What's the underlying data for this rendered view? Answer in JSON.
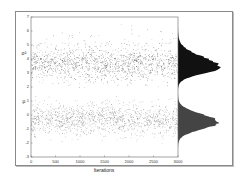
{
  "chart_data": {
    "type": "scatter",
    "title": "",
    "xlabel": "Iterations",
    "ylabel_series": [
      "σ²",
      "μ"
    ],
    "xlim": [
      0,
      3000
    ],
    "ylim": [
      -3,
      7
    ],
    "x_ticks": [
      0,
      500,
      1000,
      1500,
      2000,
      2500,
      3000
    ],
    "y_ticks": [
      -3,
      -2,
      -1,
      0,
      1,
      2,
      3,
      4,
      5,
      6,
      7
    ],
    "grid": false,
    "legend": "none",
    "series": [
      {
        "name": "σ²",
        "kind": "trace",
        "n_iterations": 3000,
        "center": 3.6,
        "spread": 0.6,
        "range": [
          2.0,
          6.5
        ],
        "color": "#222222"
      },
      {
        "name": "μ",
        "kind": "trace",
        "n_iterations": 3000,
        "center": -0.3,
        "spread": 0.55,
        "range": [
          -2.3,
          1.5
        ],
        "color": "#555555"
      }
    ],
    "marginal_histograms": [
      {
        "name": "σ²",
        "orientation": "horizontal",
        "mode": 3.5,
        "fill": "#111111"
      },
      {
        "name": "μ",
        "orientation": "horizontal",
        "mode": -0.5,
        "fill": "#444444"
      }
    ]
  },
  "labels": {
    "xlabel": "Iterations",
    "sigma": "σ²",
    "mu": "μ",
    "xticks": [
      "0",
      "500",
      "1000",
      "1500",
      "2000",
      "2500",
      "3000"
    ],
    "yticks": [
      "-3",
      "-2",
      "-1",
      "0",
      "1",
      "2",
      "3",
      "4",
      "5",
      "6",
      "7"
    ]
  }
}
